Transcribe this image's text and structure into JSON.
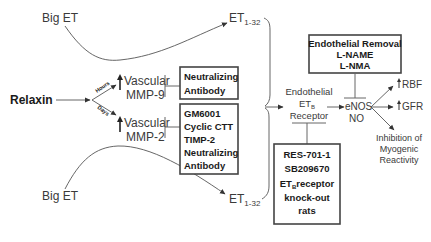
{
  "diagram": {
    "nodes": {
      "big_et_top": "Big ET",
      "big_et_bottom": "Big ET",
      "relaxin": "Relaxin",
      "branch_hours": "Hours",
      "branch_days": "Days",
      "up_arrow": "↑",
      "vascular_mmp9": {
        "line1": "Vascular",
        "line2": "MMP-9"
      },
      "vascular_mmp2": {
        "line1": "Vascular",
        "line2": "MMP-2"
      },
      "et_top": {
        "base": "ET",
        "sub": "1-32"
      },
      "et_bottom": {
        "base": "ET",
        "sub": "1-32"
      },
      "receptor": {
        "line1": "Endothelial",
        "line2_base": "ET",
        "line2_sub": "B",
        "line3": "Receptor"
      },
      "enos": {
        "line1": "eNOS",
        "line2": "NO"
      },
      "rbf": "RBF",
      "gfr": "GFR",
      "myogenic": {
        "line1": "Inhibition of",
        "line2": "Myogenic",
        "line3": "Reactivity"
      }
    },
    "inhibitor_boxes": {
      "mmp9_box": [
        "Neutralizing",
        "Antibody"
      ],
      "mmp2_box": [
        "GM6001",
        "Cyclic CTT",
        "TIMP-2",
        "Neutralizing",
        "Antibody"
      ],
      "endothelial_box": [
        "Endothelial Removal",
        "L-NAME",
        "L-NMA"
      ],
      "receptor_box": {
        "line1": "RES-701-1",
        "line2": "SB209670",
        "line3_base": "ET",
        "line3_sub": "B",
        "line3_rest": "receptor",
        "line4": "knock-out",
        "line5": "rats"
      }
    }
  }
}
